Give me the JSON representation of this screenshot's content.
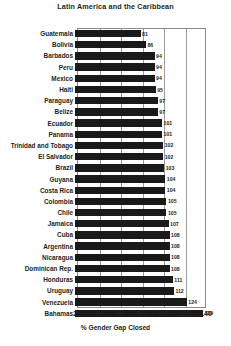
{
  "chart_data": {
    "type": "bar",
    "orientation": "horizontal",
    "title": "Latin America and the Caribbean",
    "xlabel": "% Gender Gap Closed",
    "ylabel": "",
    "xlim": [
      20,
      140
    ],
    "xticks": [
      20,
      40,
      60,
      80,
      100,
      120,
      140
    ],
    "grid": true,
    "legend": false,
    "bar_color": "#1a1a1a",
    "categories": [
      "Guatemala",
      "Bolivia",
      "Barbados",
      "Peru",
      "Mexico",
      "Haiti",
      "Paraguay",
      "Belize",
      "Ecuador",
      "Panama",
      "Trinidad and Tobago",
      "El Salvador",
      "Brazil",
      "Guyana",
      "Costa Rica",
      "Colombia",
      "Chile",
      "Jamaica",
      "Cuba",
      "Argentina",
      "Nicaragua",
      "Dominican Rep.",
      "Honduras",
      "Uruguay",
      "Venezuela",
      "Bahamas"
    ],
    "values": [
      81,
      86,
      94,
      94,
      94,
      95,
      97,
      97,
      101,
      101,
      102,
      102,
      103,
      104,
      104,
      105,
      105,
      107,
      108,
      108,
      108,
      108,
      111,
      112,
      124,
      139
    ]
  }
}
